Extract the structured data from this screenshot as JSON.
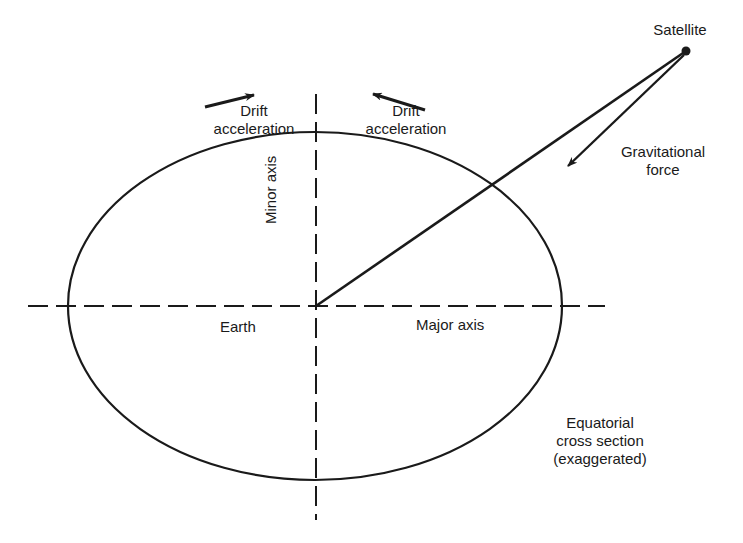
{
  "diagram": {
    "type": "orbital-mechanics-schematic",
    "labels": {
      "drift_left": {
        "line1": "Drift",
        "line2": "acceleration"
      },
      "drift_right": {
        "line1": "Drift",
        "line2": "acceleration"
      },
      "satellite": "Satellite",
      "gravitational_force": {
        "line1": "Gravitational",
        "line2": "force"
      },
      "minor_axis": "Minor axis",
      "major_axis": "Major axis",
      "earth": "Earth",
      "caption": {
        "line1": "Equatorial",
        "line2": "cross section",
        "line3": "(exaggerated)"
      }
    },
    "colors": {
      "ink": "#1a1a1a",
      "background": "#ffffff"
    }
  }
}
